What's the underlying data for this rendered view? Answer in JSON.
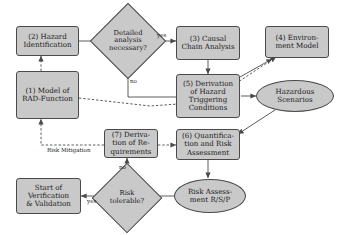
{
  "diagram": {
    "type": "flowchart",
    "colors": {
      "node_fill": "#c9c9c9",
      "node_stroke": "#4a4a4a",
      "text": "#1a1a1a",
      "background": "#ffffff"
    },
    "nodes": [
      {
        "id": "n2",
        "shape": "box",
        "label": "(2) Hazard\nIdentification"
      },
      {
        "id": "d1",
        "shape": "diamond",
        "label": "Detailed\nanalysis\nnecessary?"
      },
      {
        "id": "n3",
        "shape": "box",
        "label": "(3) Causal\nChain Analysis"
      },
      {
        "id": "n4",
        "shape": "box",
        "label": "(4) Environ-\nment Model"
      },
      {
        "id": "n1",
        "shape": "box",
        "label": "(1) Model of\nRAD-Function"
      },
      {
        "id": "n5",
        "shape": "box",
        "label": "(5) Derivation\nof Hazard\nTriggering\nConditions"
      },
      {
        "id": "e1",
        "shape": "ellipse",
        "label": "Hazardous\nScenarios"
      },
      {
        "id": "n7",
        "shape": "box",
        "label": "(7) Deriva-\ntion of Re-\nquirements"
      },
      {
        "id": "n6",
        "shape": "box",
        "label": "(6) Quantifica-\ntion and Risk\nAssessment"
      },
      {
        "id": "d2",
        "shape": "diamond",
        "label": "Risk\ntolerable?"
      },
      {
        "id": "e2",
        "shape": "ellipse",
        "label": "Risk Assess-\nment R/S/P"
      },
      {
        "id": "n8",
        "shape": "box",
        "label": "Start of\nVerification\n& Validation"
      }
    ],
    "edge_labels": [
      {
        "id": "yes1",
        "text": "yes"
      },
      {
        "id": "no1",
        "text": "no"
      },
      {
        "id": "rm",
        "text": "Risk Mitigation"
      },
      {
        "id": "no2",
        "text": "no"
      },
      {
        "id": "yes2",
        "text": "yes"
      }
    ]
  }
}
